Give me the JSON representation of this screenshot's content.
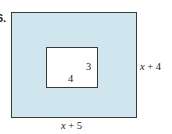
{
  "problem_number": "6.",
  "figure": {
    "outer_rectangle": {
      "width_label": "x + 5",
      "height_label": "x + 4",
      "fill": "#cfe6ef"
    },
    "inner_rectangle": {
      "width_label": "4",
      "height_label": "3",
      "fill": "#ffffff"
    }
  },
  "labels": {
    "outer_height": "x + 4",
    "outer_width": "x + 5",
    "inner_height": "3",
    "inner_width": "4"
  }
}
